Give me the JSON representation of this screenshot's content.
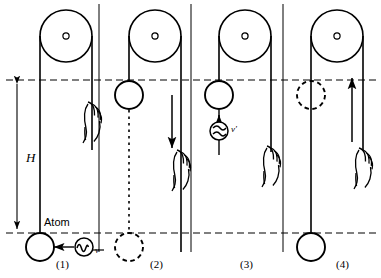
{
  "figure": {
    "type": "physics-thought-experiment-diagram",
    "background_color": "#ffffff",
    "ink_color": "#000000"
  },
  "labels": {
    "height": "H",
    "atom": "Atom",
    "photon_emitted": "ν",
    "photon_absorbed": "ν′"
  },
  "panels": [
    {
      "id": "panel-1",
      "caption": "(1)",
      "state": "atom at bottom emits photon of frequency ν to the left",
      "mass_position": "bottom",
      "mass_style": "solid",
      "hand": "grips rope on right side, upper area",
      "photon": {
        "symbol": "ν",
        "direction": "left",
        "style": "solid"
      },
      "arrow": null
    },
    {
      "id": "panel-2",
      "caption": "(2)",
      "state": "mass at top dashed level, lowered to bottom",
      "mass_position": "top",
      "mass_style": "solid",
      "ghost_position": "bottom",
      "ghost_style": "dashed",
      "hand": "grips rope on right side, lower area",
      "arrow": {
        "direction": "down",
        "label": ""
      }
    },
    {
      "id": "panel-3",
      "caption": "(3)",
      "state": "mass at top dashed level absorbs photon of frequency ν′ arriving from below",
      "mass_position": "top",
      "mass_style": "solid",
      "hand": "grips rope on right side, middle area",
      "photon": {
        "symbol": "ν′",
        "direction": "down",
        "style": "solid"
      },
      "arrow": null
    },
    {
      "id": "panel-4",
      "caption": "(4)",
      "state": "mass returned to bottom, rope pulled up",
      "mass_position": "bottom",
      "mass_style": "solid",
      "ghost_position": "top",
      "ghost_style": "dashed",
      "hand": "grips rope on right side, lower area",
      "arrow": {
        "direction": "up",
        "label": ""
      }
    }
  ],
  "guides": {
    "upper_dashed_line_label": "upper level",
    "lower_dashed_line_label": "lower level",
    "height_arrow": "double-headed vertical arrow spanning H"
  }
}
